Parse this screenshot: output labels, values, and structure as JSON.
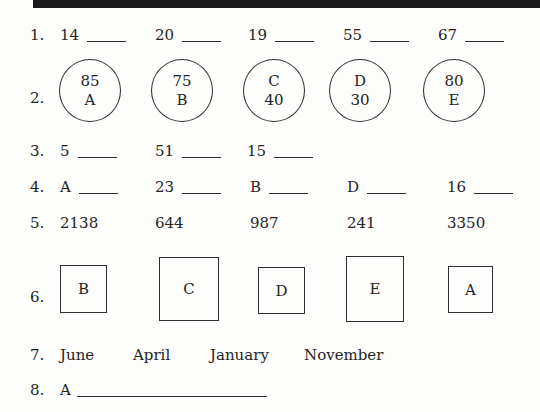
{
  "worksheet": {
    "top_bar": {
      "color": "#1b1b1b"
    },
    "text_color": "#242424",
    "rows": {
      "r1": {
        "label": "1.",
        "items": [
          {
            "text": "14"
          },
          {
            "text": "20"
          },
          {
            "text": "19"
          },
          {
            "text": "55"
          },
          {
            "text": "67"
          }
        ]
      },
      "r2": {
        "label": "2.",
        "circles": [
          {
            "line1": "85",
            "line2": "A"
          },
          {
            "line1": "75",
            "line2": "B"
          },
          {
            "line1": "C",
            "line2": "40"
          },
          {
            "line1": "D",
            "line2": "30"
          },
          {
            "line1": "80",
            "line2": "E"
          }
        ]
      },
      "r3": {
        "label": "3.",
        "items": [
          {
            "text": "5"
          },
          {
            "text": "51"
          },
          {
            "text": "15"
          }
        ]
      },
      "r4": {
        "label": "4.",
        "items": [
          {
            "text": "A"
          },
          {
            "text": "23"
          },
          {
            "text": "B"
          },
          {
            "text": "D"
          },
          {
            "text": "16"
          }
        ]
      },
      "r5": {
        "label": "5.",
        "items": [
          {
            "text": "2138"
          },
          {
            "text": "644"
          },
          {
            "text": "987"
          },
          {
            "text": "241"
          },
          {
            "text": "3350"
          }
        ]
      },
      "r6": {
        "label": "6.",
        "squares": [
          {
            "letter": "B"
          },
          {
            "letter": "C"
          },
          {
            "letter": "D"
          },
          {
            "letter": "E"
          },
          {
            "letter": "A"
          }
        ]
      },
      "r7": {
        "label": "7.",
        "months": [
          "June",
          "April",
          "January",
          "November"
        ]
      },
      "r8": {
        "label": "8.",
        "prefix": "A"
      }
    }
  }
}
